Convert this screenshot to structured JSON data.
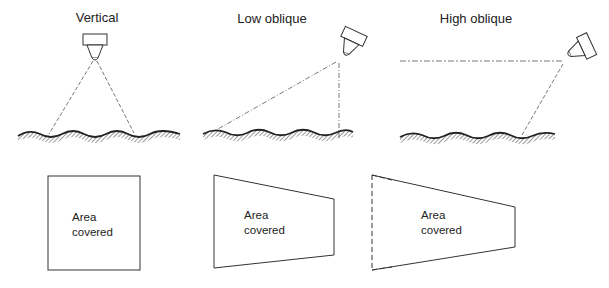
{
  "panels": [
    {
      "id": "vertical",
      "title": "Vertical",
      "area_label_line1": "Area",
      "area_label_line2": "covered",
      "footprint_shape": "square"
    },
    {
      "id": "low-oblique",
      "title": "Low oblique",
      "area_label_line1": "Area",
      "area_label_line2": "covered",
      "footprint_shape": "trapezoid"
    },
    {
      "id": "high-oblique",
      "title": "High oblique",
      "area_label_line1": "Area",
      "area_label_line2": "covered",
      "footprint_shape": "trapezoid-open-far-edge"
    }
  ],
  "colors": {
    "line": "#333333",
    "dashed_ray": "#555555",
    "hatch": "#555555",
    "background": "#ffffff"
  }
}
